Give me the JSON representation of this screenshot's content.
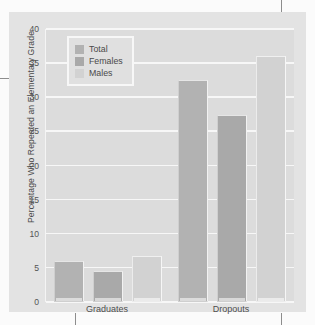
{
  "chart_data": {
    "type": "bar",
    "title": "",
    "xlabel": "",
    "ylabel": "Percentage Who Repeated an Elementary Grade",
    "ylim": [
      0,
      40
    ],
    "ytick_step": 5,
    "yticks": [
      "40",
      "35",
      "30",
      "25",
      "20",
      "15",
      "10",
      "5",
      "0"
    ],
    "grid": true,
    "legend_position": "top-left",
    "categories": [
      "Graduates",
      "Dropouts"
    ],
    "series": [
      {
        "name": "Total",
        "values": [
          6.0,
          32.6
        ],
        "color": "#b2b2b2"
      },
      {
        "name": "Females",
        "values": [
          4.6,
          27.4
        ],
        "color": "#a9a9a9"
      },
      {
        "name": "Males",
        "values": [
          6.7,
          36.0
        ],
        "color": "#d2d2d2"
      }
    ]
  },
  "legend": {
    "items": [
      {
        "label": "Total",
        "swatch": "total"
      },
      {
        "label": "Females",
        "swatch": "females"
      },
      {
        "label": "Males",
        "swatch": "males"
      }
    ]
  },
  "colors": {
    "panel_background": "#e3e3e3",
    "plot_background": "#dcdcdc",
    "gridline": "#f7f7f7",
    "text": "#4a4a4a"
  }
}
